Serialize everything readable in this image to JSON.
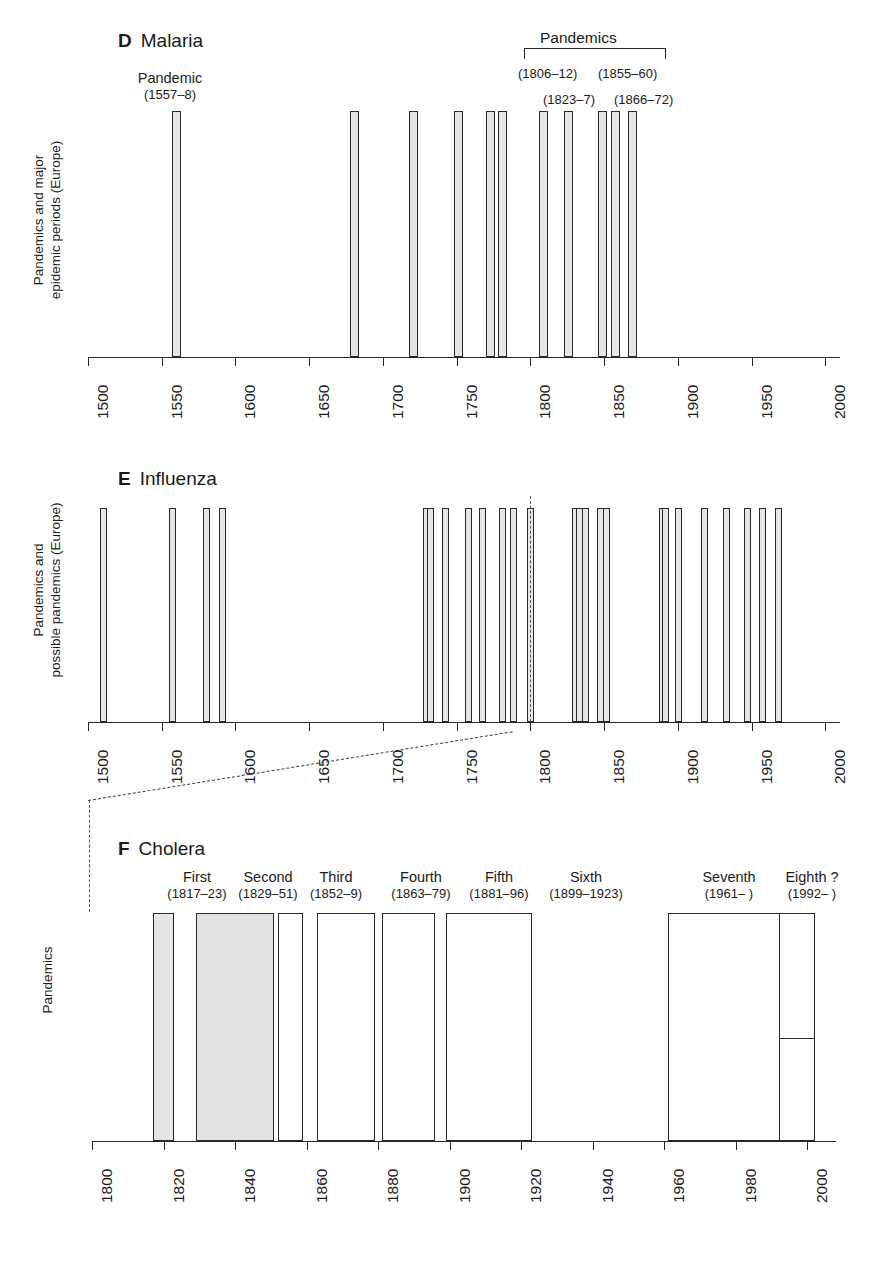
{
  "figure": {
    "panels": [
      {
        "letter": "D",
        "title": "Malaria",
        "ylabel_line1": "Pandemics and major",
        "ylabel_line2": "epidemic periods (Europe)",
        "annotations": {
          "left_label": "Pandemic",
          "left_years": "(1557–8)",
          "bracket_label": "Pandemics",
          "years_row1_a": "(1806–12)",
          "years_row1_b": "(1855–60)",
          "years_row2_a": "(1823–7)",
          "years_row2_b": "(1866–72)"
        },
        "axis": {
          "min": 1500,
          "max": 2010,
          "ticks": [
            1500,
            1550,
            1600,
            1650,
            1700,
            1750,
            1800,
            1850,
            1900,
            1950,
            2000
          ],
          "tick_labels": [
            "1500",
            "1550",
            "1600",
            "1650",
            "1700",
            "1750",
            "1800",
            "1850",
            "1900",
            "1950",
            "2000"
          ]
        }
      },
      {
        "letter": "E",
        "title": "Influenza",
        "ylabel_line1": "Pandemics and",
        "ylabel_line2": "possible pandemics (Europe)",
        "axis": {
          "min": 1500,
          "max": 2010,
          "ticks": [
            1500,
            1550,
            1600,
            1650,
            1700,
            1750,
            1800,
            1850,
            1900,
            1950,
            2000
          ],
          "tick_labels": [
            "1500",
            "1550",
            "1600",
            "1650",
            "1700",
            "1750",
            "1800",
            "1850",
            "1900",
            "1950",
            "2000"
          ]
        }
      },
      {
        "letter": "F",
        "title": "Cholera",
        "ylabel_line1": "Pandemics",
        "annotations": [
          {
            "name": "First",
            "years": "(1817–23)"
          },
          {
            "name": "Second",
            "years": "(1829–51)"
          },
          {
            "name": "Third",
            "years": "(1852–9)"
          },
          {
            "name": "Fourth",
            "years": "(1863–79)"
          },
          {
            "name": "Fifth",
            "years": "(1881–96)"
          },
          {
            "name": "Sixth",
            "years": "(1899–1923)"
          },
          {
            "name": "Seventh",
            "years": "(1961–  )"
          },
          {
            "name": "Eighth ?",
            "years": "(1992–  )"
          }
        ],
        "axis": {
          "min": 1800,
          "max": 2008,
          "ticks": [
            1800,
            1820,
            1840,
            1860,
            1880,
            1900,
            1920,
            1940,
            1960,
            1980,
            2000
          ],
          "tick_labels": [
            "1800",
            "1820",
            "1840",
            "1860",
            "1880",
            "1900",
            "1920",
            "1940",
            "1960",
            "1980",
            "2000"
          ]
        }
      }
    ]
  },
  "chart_data": [
    {
      "type": "bar",
      "panel": "D",
      "title": "Malaria",
      "xlabel": "",
      "ylabel": "Pandemics and major epidemic periods (Europe)",
      "xlim": [
        1500,
        2010
      ],
      "grid": false,
      "series_name": "Malaria pandemics and major epidemic periods (Europe)",
      "intervals": [
        {
          "start": 1557,
          "end": 1558,
          "label": "Pandemic (1557–8)"
        },
        {
          "start": 1678,
          "end": 1682,
          "label": ""
        },
        {
          "start": 1718,
          "end": 1722,
          "label": ""
        },
        {
          "start": 1748,
          "end": 1752,
          "label": ""
        },
        {
          "start": 1770,
          "end": 1774,
          "label": ""
        },
        {
          "start": 1778,
          "end": 1782,
          "label": ""
        },
        {
          "start": 1806,
          "end": 1812,
          "label": "Pandemic (1806–12)"
        },
        {
          "start": 1823,
          "end": 1827,
          "label": "Pandemic (1823–7)"
        },
        {
          "start": 1846,
          "end": 1851,
          "label": ""
        },
        {
          "start": 1855,
          "end": 1860,
          "label": "Pandemic (1855–60)"
        },
        {
          "start": 1866,
          "end": 1872,
          "label": "Pandemic (1866–72)"
        }
      ]
    },
    {
      "type": "bar",
      "panel": "E",
      "title": "Influenza",
      "xlabel": "",
      "ylabel": "Pandemics and possible pandemics (Europe)",
      "xlim": [
        1500,
        2010
      ],
      "grid": false,
      "series_name": "Influenza pandemics and possible pandemics (Europe)",
      "events": [
        1510,
        1557,
        1580,
        1591,
        1729,
        1732,
        1742,
        1758,
        1767,
        1781,
        1788,
        1800,
        1830,
        1833,
        1837,
        1847,
        1851,
        1889,
        1891,
        1900,
        1918,
        1933,
        1947,
        1957,
        1968
      ]
    },
    {
      "type": "bar",
      "panel": "F",
      "title": "Cholera",
      "xlabel": "",
      "ylabel": "Pandemics",
      "xlim": [
        1800,
        2008
      ],
      "grid": false,
      "series_name": "Cholera pandemics",
      "intervals": [
        {
          "name": "First",
          "start": 1817,
          "end": 1823,
          "height": 1.0
        },
        {
          "name": "Second",
          "start": 1829,
          "end": 1851,
          "height": 1.0
        },
        {
          "name": "Third",
          "start": 1852,
          "end": 1859,
          "height": 1.0
        },
        {
          "name": "Fourth",
          "start": 1863,
          "end": 1879,
          "height": 1.0
        },
        {
          "name": "Fifth",
          "start": 1881,
          "end": 1896,
          "height": 1.0
        },
        {
          "name": "Sixth",
          "start": 1899,
          "end": 1923,
          "height": 1.0
        },
        {
          "name": "Seventh",
          "start": 1961,
          "end": 2002,
          "height": 1.0
        },
        {
          "name": "Eighth ?",
          "start": 1992,
          "end": 2002,
          "height": 0.45
        }
      ]
    }
  ]
}
